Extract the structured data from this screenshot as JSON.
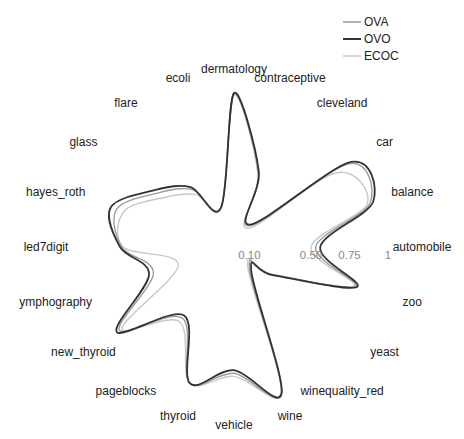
{
  "chart_data": {
    "type": "radar",
    "title": "",
    "categories": [
      "automobile",
      "balance",
      "car",
      "cleveland",
      "contraceptive",
      "dermatology",
      "ecoli",
      "flare",
      "glass",
      "hayes_roth",
      "led7digit",
      "ymphography",
      "new_thyroid",
      "pageblocks",
      "thyroid",
      "vehicle",
      "wine",
      "winequality_red",
      "yeast",
      "zoo"
    ],
    "radial_ticks": [
      {
        "value": 0.1,
        "label": "0.10"
      },
      {
        "value": 0.5,
        "label": "0.50"
      },
      {
        "value": 0.75,
        "label": "0.75"
      },
      {
        "value": 1,
        "label": "1"
      }
    ],
    "rlim": [
      0,
      1
    ],
    "grid": false,
    "legend_position": "top-right",
    "series": [
      {
        "name": "OVA",
        "color": "#9a9a9a",
        "values": [
          0.53,
          0.93,
          0.92,
          0.17,
          0.51,
          0.99,
          0.27,
          0.46,
          0.6,
          0.8,
          0.73,
          0.55,
          0.92,
          0.57,
          0.93,
          0.82,
          1.0,
          0.17,
          0.3,
          0.83
        ]
      },
      {
        "name": "OVO",
        "color": "#333333",
        "values": [
          0.56,
          0.95,
          0.94,
          0.18,
          0.52,
          1.0,
          0.27,
          0.48,
          0.63,
          0.84,
          0.74,
          0.58,
          0.94,
          0.55,
          0.93,
          0.8,
          1.0,
          0.19,
          0.31,
          0.84
        ]
      },
      {
        "name": "ECOC",
        "color": "#c8c8c8",
        "values": [
          0.5,
          0.91,
          0.82,
          0.15,
          0.5,
          0.99,
          0.27,
          0.42,
          0.55,
          0.75,
          0.72,
          0.38,
          0.9,
          0.6,
          0.93,
          0.84,
          0.99,
          0.15,
          0.31,
          0.82
        ]
      }
    ]
  }
}
